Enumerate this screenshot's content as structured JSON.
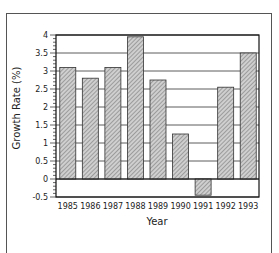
{
  "chart_data": {
    "type": "bar",
    "title": "",
    "xlabel": "Year",
    "ylabel": "Growth Rate (%)",
    "categories": [
      "1985",
      "1986",
      "1987",
      "1988",
      "1989",
      "1990",
      "1991",
      "1992",
      "1993"
    ],
    "values": [
      3.1,
      2.8,
      3.1,
      3.95,
      2.75,
      1.25,
      -0.45,
      2.55,
      3.5
    ],
    "ylim": [
      -0.5,
      4
    ],
    "yticks": [
      "4",
      "3.5",
      "3",
      "2.5",
      "2",
      "1.5",
      "1",
      "0.5",
      "0",
      "-0.5"
    ],
    "grid": true,
    "legend": null,
    "bar_fill": "hatched gray"
  },
  "colors": {
    "bar_fill": "#c8c8c8",
    "bar_hatch": "#7a7a7a",
    "axis": "#222222",
    "grid": "#333333"
  }
}
